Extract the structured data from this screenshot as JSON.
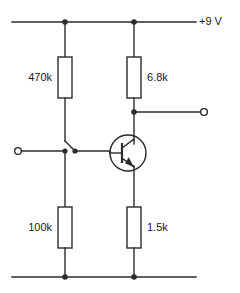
{
  "diagram": {
    "type": "schematic",
    "colors": {
      "background": "#ffffff",
      "wire": "#2b2b2b",
      "text": "#1a1a1a"
    }
  },
  "rails": {
    "supply_label": "+9 V",
    "ground_label": ""
  },
  "components": {
    "r_base_upper": {
      "label": "470k",
      "designation": "resistor"
    },
    "r_base_lower": {
      "label": "100k",
      "designation": "resistor"
    },
    "r_collector": {
      "label": "6.8k",
      "designation": "resistor"
    },
    "r_emitter": {
      "label": "1.5k",
      "designation": "resistor"
    },
    "transistor": {
      "label": "",
      "designation": "npn-transistor"
    },
    "switch": {
      "label": "",
      "designation": "spst-switch"
    }
  },
  "terminals": {
    "input": {
      "label": "",
      "designation": "input-terminal"
    },
    "output": {
      "label": "",
      "designation": "output-terminal"
    }
  }
}
